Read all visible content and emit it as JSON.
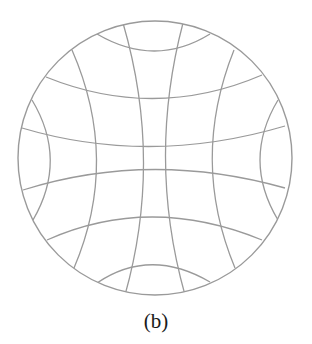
{
  "figure": {
    "caption": "(b)",
    "stroke_color": "#9a9a9a",
    "circle": {
      "cx": 155,
      "cy": 158,
      "r": 137
    },
    "horizontal_curves": [
      {
        "name": "top-cap",
        "d": "M97,34 Q155,68 210,34"
      },
      {
        "name": "upper",
        "d": "M46,77 Q155,121 262,75"
      },
      {
        "name": "mid-upper",
        "d": "M22,128 Q150,166 285,126"
      },
      {
        "name": "mid-lower",
        "d": "M23,190 Q150,150 285,188"
      },
      {
        "name": "lower",
        "d": "M47,240 Q150,194 262,240"
      },
      {
        "name": "bottom-cap",
        "d": "M97,283 Q150,247 210,282"
      }
    ],
    "vertical_curves": [
      {
        "name": "left-cap",
        "d": "M32,100 Q68,160 33,220"
      },
      {
        "name": "left-2",
        "d": "M72,50 Q120,160 74,268"
      },
      {
        "name": "center-left",
        "d": "M123,23 Q163,160 125,295"
      },
      {
        "name": "center-right",
        "d": "M183,23 Q147,160 185,295"
      },
      {
        "name": "right-2",
        "d": "M234,50 Q190,160 235,268"
      },
      {
        "name": "right-cap",
        "d": "M278,100 Q242,160 278,220"
      }
    ]
  }
}
